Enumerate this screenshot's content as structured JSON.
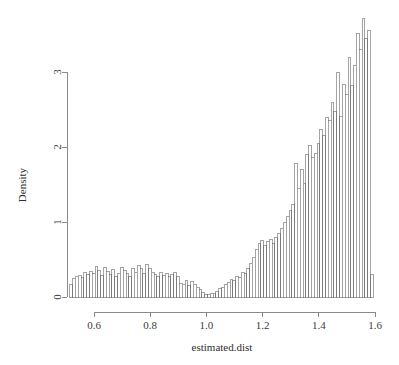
{
  "chart_data": {
    "type": "bar",
    "chart_subtype": "histogram",
    "title": "",
    "xlabel": "estimated.dist",
    "ylabel": "Density",
    "xlim": [
      0.514,
      1.596
    ],
    "ylim": [
      0,
      3.75
    ],
    "xticks": [
      0.6,
      0.8,
      1.0,
      1.2,
      1.4,
      1.6
    ],
    "xticklabels": [
      "0.6",
      "0.8",
      "1.0",
      "1.2",
      "1.4",
      "1.6"
    ],
    "yticks": [
      0,
      1,
      2,
      3
    ],
    "yticklabels": [
      "0",
      "1",
      "2",
      "3"
    ],
    "grid": false,
    "legend": null,
    "bin_width": 0.01,
    "bin_starts": [
      0.514,
      0.524,
      0.534,
      0.544,
      0.554,
      0.564,
      0.574,
      0.584,
      0.594,
      0.604,
      0.614,
      0.624,
      0.634,
      0.644,
      0.654,
      0.664,
      0.674,
      0.684,
      0.694,
      0.704,
      0.714,
      0.724,
      0.734,
      0.744,
      0.754,
      0.764,
      0.774,
      0.784,
      0.794,
      0.804,
      0.814,
      0.824,
      0.834,
      0.844,
      0.854,
      0.864,
      0.874,
      0.884,
      0.894,
      0.904,
      0.914,
      0.924,
      0.934,
      0.944,
      0.954,
      0.964,
      0.974,
      0.984,
      0.994,
      1.004,
      1.014,
      1.024,
      1.034,
      1.044,
      1.054,
      1.064,
      1.074,
      1.084,
      1.094,
      1.104,
      1.114,
      1.124,
      1.134,
      1.144,
      1.154,
      1.164,
      1.174,
      1.184,
      1.194,
      1.204,
      1.214,
      1.224,
      1.234,
      1.244,
      1.254,
      1.264,
      1.274,
      1.284,
      1.294,
      1.304,
      1.314,
      1.324,
      1.334,
      1.344,
      1.354,
      1.364,
      1.374,
      1.384,
      1.394,
      1.404,
      1.414,
      1.424,
      1.434,
      1.444,
      1.454,
      1.464,
      1.474,
      1.484,
      1.494,
      1.504,
      1.514,
      1.524,
      1.534,
      1.544,
      1.554,
      1.564,
      1.574,
      1.584
    ],
    "values": [
      0.17,
      0.25,
      0.27,
      0.29,
      0.26,
      0.33,
      0.3,
      0.34,
      0.31,
      0.41,
      0.35,
      0.29,
      0.39,
      0.34,
      0.3,
      0.37,
      0.28,
      0.32,
      0.4,
      0.35,
      0.31,
      0.28,
      0.38,
      0.33,
      0.42,
      0.38,
      0.31,
      0.44,
      0.38,
      0.33,
      0.3,
      0.28,
      0.33,
      0.29,
      0.31,
      0.27,
      0.3,
      0.33,
      0.28,
      0.18,
      0.17,
      0.22,
      0.15,
      0.21,
      0.17,
      0.13,
      0.1,
      0.06,
      0.04,
      0.03,
      0.05,
      0.05,
      0.08,
      0.11,
      0.13,
      0.17,
      0.2,
      0.24,
      0.22,
      0.28,
      0.26,
      0.33,
      0.31,
      0.38,
      0.45,
      0.53,
      0.64,
      0.72,
      0.76,
      0.69,
      0.74,
      0.77,
      0.71,
      0.8,
      0.85,
      0.92,
      0.99,
      1.08,
      1.15,
      1.24,
      1.78,
      1.45,
      1.7,
      1.52,
      1.9,
      2.02,
      1.86,
      1.92,
      2.05,
      2.24,
      2.16,
      2.4,
      2.35,
      2.6,
      2.48,
      2.99,
      2.41,
      2.83,
      2.7,
      3.2,
      2.82,
      3.09,
      3.52,
      3.3,
      3.72,
      3.45,
      3.55,
      0.3
    ]
  },
  "axes": {
    "y_axis_label": "Density",
    "x_axis_label": "estimated.dist"
  },
  "style": {
    "bar_fill": "#ffffff",
    "bar_stroke": "#5a5a5a",
    "axis_color": "#8a8a8a",
    "text_color": "#3c3c3c",
    "background": "#ffffff"
  }
}
